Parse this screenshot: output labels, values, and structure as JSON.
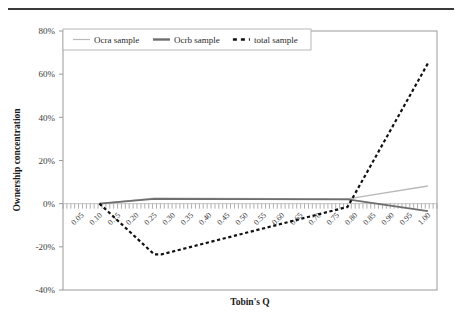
{
  "figure": {
    "background": "#ffffff",
    "top_rule_color": "#3a3a3a"
  },
  "axis_titles": {
    "y": "Ownership concentration",
    "x": "Tobin's Q"
  },
  "legend": {
    "items": [
      {
        "label": "Ocra sample",
        "style": "solid-thin",
        "color": "#b9b9b9"
      },
      {
        "label": "Ocrb sample",
        "style": "solid-thick",
        "color": "#6e6e6e"
      },
      {
        "label": "total sample",
        "style": "dashed",
        "color": "#111111"
      }
    ]
  },
  "chart_data": {
    "type": "line",
    "title": "",
    "xlabel": "Tobin's Q",
    "ylabel": "Ownership concentration",
    "xlim": [
      0.0,
      1.025
    ],
    "ylim": [
      -0.4,
      0.8
    ],
    "grid": false,
    "legend_position": "top-inside",
    "x": [
      0.05,
      0.1,
      0.15,
      0.2,
      0.25,
      0.3,
      0.35,
      0.4,
      0.45,
      0.5,
      0.55,
      0.6,
      0.65,
      0.7,
      0.75,
      0.8,
      0.85,
      0.9,
      0.95,
      1.0
    ],
    "categories": [
      "0.05",
      "0.10",
      "0.15",
      "0.20",
      "0.25",
      "0.30",
      "0.35",
      "0.40",
      "0.45",
      "0.50",
      "0.55",
      "0.60",
      "0.65",
      "0.70",
      "0.75",
      "0.80",
      "0.85",
      "0.90",
      "0.95",
      "1.00"
    ],
    "yticks": [
      -0.4,
      -0.2,
      0.0,
      0.2,
      0.4,
      0.6,
      0.8
    ],
    "ytick_labels": [
      "-40%",
      "-20%",
      "0%",
      "20%",
      "40%",
      "60%",
      "80%"
    ],
    "series": [
      {
        "name": "Ocra sample",
        "color": "#b9b9b9",
        "style": "solid",
        "width": 1.4,
        "points": [
          {
            "x": 0.1,
            "y": 0.0
          },
          {
            "x": 0.25,
            "y": 0.025
          },
          {
            "x": 0.78,
            "y": 0.022
          },
          {
            "x": 1.0,
            "y": 0.082
          }
        ]
      },
      {
        "name": "Ocrb sample",
        "color": "#6e6e6e",
        "style": "solid",
        "width": 1.8,
        "points": [
          {
            "x": 0.1,
            "y": 0.0
          },
          {
            "x": 0.25,
            "y": 0.022
          },
          {
            "x": 0.78,
            "y": 0.02
          },
          {
            "x": 1.0,
            "y": -0.035
          }
        ]
      },
      {
        "name": "total sample",
        "color": "#111111",
        "style": "dashed",
        "width": 2.2,
        "points": [
          {
            "x": 0.1,
            "y": 0.0
          },
          {
            "x": 0.25,
            "y": -0.235
          },
          {
            "x": 0.27,
            "y": -0.235
          },
          {
            "x": 0.78,
            "y": -0.015
          },
          {
            "x": 1.0,
            "y": 0.65
          }
        ]
      }
    ]
  }
}
